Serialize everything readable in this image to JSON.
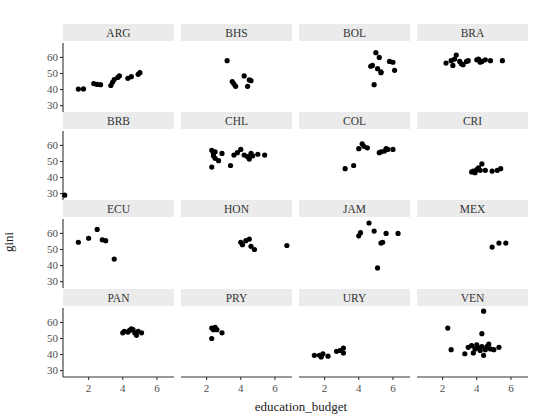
{
  "chart_data": {
    "type": "scatter",
    "title": "",
    "xlabel": "education_budget",
    "ylabel": "gini",
    "facet_layout": {
      "nrow": 4,
      "ncol": 4
    },
    "xlim": [
      0.5,
      7.0
    ],
    "ylim": [
      26,
      69
    ],
    "x_ticks": [
      2,
      4,
      6
    ],
    "y_ticks": [
      30,
      40,
      50,
      60
    ],
    "grid": false,
    "legend": "none",
    "panels": [
      {
        "label": "ARG",
        "points": [
          [
            1.4,
            40.3
          ],
          [
            1.7,
            40.4
          ],
          [
            2.3,
            43.7
          ],
          [
            2.5,
            43.2
          ],
          [
            2.7,
            43.0
          ],
          [
            3.3,
            42.5
          ],
          [
            3.4,
            44.5
          ],
          [
            3.5,
            46.2
          ],
          [
            3.7,
            47.5
          ],
          [
            3.8,
            48.5
          ],
          [
            4.3,
            47.0
          ],
          [
            4.5,
            48.0
          ],
          [
            4.9,
            49.5
          ],
          [
            5.0,
            50.5
          ]
        ]
      },
      {
        "label": "BHS",
        "points": [
          [
            3.2,
            58.0
          ],
          [
            3.5,
            45.0
          ],
          [
            3.6,
            43.5
          ],
          [
            3.7,
            42.0
          ],
          [
            4.2,
            48.5
          ],
          [
            4.4,
            42.0
          ],
          [
            4.5,
            46.0
          ],
          [
            4.6,
            45.5
          ]
        ]
      },
      {
        "label": "BOL",
        "points": [
          [
            5.0,
            63.0
          ],
          [
            5.2,
            60.0
          ],
          [
            4.8,
            55.0
          ],
          [
            4.7,
            54.5
          ],
          [
            5.1,
            53.0
          ],
          [
            5.3,
            51.0
          ],
          [
            5.3,
            50.5
          ],
          [
            5.8,
            57.5
          ],
          [
            6.0,
            57.0
          ],
          [
            6.1,
            52.0
          ],
          [
            4.9,
            43.0
          ]
        ]
      },
      {
        "label": "BRA",
        "points": [
          [
            2.2,
            56.5
          ],
          [
            2.5,
            58.0
          ],
          [
            2.6,
            55.0
          ],
          [
            2.7,
            59.0
          ],
          [
            2.8,
            61.5
          ],
          [
            3.0,
            57.5
          ],
          [
            3.1,
            56.0
          ],
          [
            3.2,
            55.5
          ],
          [
            3.4,
            57.5
          ],
          [
            3.5,
            58.0
          ],
          [
            4.0,
            58.5
          ],
          [
            4.1,
            59.0
          ],
          [
            4.2,
            57.0
          ],
          [
            4.3,
            57.5
          ],
          [
            4.5,
            58.5
          ],
          [
            4.8,
            58.0
          ],
          [
            5.5,
            58.0
          ]
        ]
      },
      {
        "label": "BRB",
        "points": [
          [
            0.6,
            29.0
          ]
        ]
      },
      {
        "label": "CHL",
        "points": [
          [
            2.3,
            57.0
          ],
          [
            2.4,
            55.0
          ],
          [
            2.4,
            53.5
          ],
          [
            2.5,
            56.0
          ],
          [
            2.5,
            52.0
          ],
          [
            2.7,
            50.5
          ],
          [
            2.3,
            46.5
          ],
          [
            2.9,
            55.0
          ],
          [
            3.4,
            47.5
          ],
          [
            3.6,
            54.0
          ],
          [
            3.8,
            55.5
          ],
          [
            4.0,
            57.5
          ],
          [
            4.2,
            54.0
          ],
          [
            4.4,
            53.0
          ],
          [
            4.5,
            51.5
          ],
          [
            4.6,
            55.0
          ],
          [
            4.7,
            53.5
          ],
          [
            5.0,
            54.5
          ],
          [
            5.4,
            54.0
          ]
        ]
      },
      {
        "label": "COL",
        "points": [
          [
            3.2,
            45.5
          ],
          [
            3.7,
            47.5
          ],
          [
            4.0,
            58.0
          ],
          [
            4.2,
            61.0
          ],
          [
            4.3,
            59.5
          ],
          [
            4.5,
            58.5
          ],
          [
            5.2,
            55.5
          ],
          [
            5.3,
            56.0
          ],
          [
            5.5,
            56.5
          ],
          [
            5.6,
            58.0
          ],
          [
            5.7,
            57.5
          ],
          [
            6.0,
            57.5
          ]
        ]
      },
      {
        "label": "CRI",
        "points": [
          [
            3.7,
            43.5
          ],
          [
            3.8,
            44.0
          ],
          [
            3.9,
            43.0
          ],
          [
            4.0,
            45.0
          ],
          [
            4.1,
            46.0
          ],
          [
            4.2,
            44.5
          ],
          [
            4.3,
            48.5
          ],
          [
            4.5,
            44.5
          ],
          [
            4.9,
            44.0
          ],
          [
            5.2,
            44.5
          ],
          [
            5.4,
            45.5
          ]
        ]
      },
      {
        "label": "ECU",
        "points": [
          [
            1.4,
            54.5
          ],
          [
            2.0,
            57.0
          ],
          [
            2.5,
            62.5
          ],
          [
            2.8,
            56.0
          ],
          [
            3.0,
            55.5
          ],
          [
            3.5,
            44.0
          ]
        ]
      },
      {
        "label": "HON",
        "points": [
          [
            4.0,
            54.5
          ],
          [
            4.1,
            53.0
          ],
          [
            4.3,
            55.5
          ],
          [
            4.5,
            56.5
          ],
          [
            4.6,
            52.0
          ],
          [
            4.8,
            50.0
          ],
          [
            6.7,
            52.5
          ]
        ]
      },
      {
        "label": "JAM",
        "points": [
          [
            4.0,
            58.5
          ],
          [
            4.1,
            60.5
          ],
          [
            4.6,
            66.5
          ],
          [
            4.9,
            61.5
          ],
          [
            5.3,
            54.0
          ],
          [
            5.4,
            54.5
          ],
          [
            5.6,
            60.0
          ],
          [
            6.3,
            60.0
          ],
          [
            5.1,
            38.5
          ]
        ]
      },
      {
        "label": "MEX",
        "points": [
          [
            4.9,
            51.5
          ],
          [
            5.3,
            54.0
          ],
          [
            5.7,
            54.0
          ]
        ]
      },
      {
        "label": "PAN",
        "points": [
          [
            4.0,
            53.5
          ],
          [
            4.1,
            54.5
          ],
          [
            4.3,
            54.0
          ],
          [
            4.4,
            55.0
          ],
          [
            4.5,
            56.0
          ],
          [
            4.6,
            55.5
          ],
          [
            4.7,
            53.5
          ],
          [
            4.8,
            52.0
          ],
          [
            4.9,
            54.5
          ],
          [
            5.1,
            53.5
          ]
        ]
      },
      {
        "label": "PRY",
        "points": [
          [
            2.3,
            50.0
          ],
          [
            2.3,
            56.5
          ],
          [
            2.4,
            55.5
          ],
          [
            2.5,
            57.0
          ],
          [
            2.6,
            55.5
          ],
          [
            2.9,
            53.5
          ]
        ]
      },
      {
        "label": "URY",
        "points": [
          [
            1.4,
            39.5
          ],
          [
            1.7,
            39.5
          ],
          [
            1.8,
            38.5
          ],
          [
            1.9,
            40.5
          ],
          [
            2.2,
            39.0
          ],
          [
            2.7,
            42.0
          ],
          [
            2.9,
            42.5
          ],
          [
            3.1,
            41.0
          ],
          [
            3.1,
            44.0
          ]
        ]
      },
      {
        "label": "VEN",
        "points": [
          [
            2.3,
            56.5
          ],
          [
            2.5,
            43.0
          ],
          [
            3.3,
            40.5
          ],
          [
            3.5,
            44.5
          ],
          [
            3.7,
            45.5
          ],
          [
            3.8,
            41.0
          ],
          [
            3.9,
            43.5
          ],
          [
            4.0,
            46.0
          ],
          [
            4.1,
            44.0
          ],
          [
            4.2,
            42.5
          ],
          [
            4.3,
            53.0
          ],
          [
            4.3,
            45.0
          ],
          [
            4.4,
            67.0
          ],
          [
            4.4,
            39.5
          ],
          [
            4.5,
            43.0
          ],
          [
            4.6,
            45.0
          ],
          [
            4.7,
            46.5
          ],
          [
            4.8,
            43.5
          ],
          [
            5.0,
            43.0
          ],
          [
            5.3,
            44.5
          ]
        ]
      }
    ]
  },
  "colors": {
    "strip_background": "#ebebeb",
    "point": "#000000",
    "axis": "#333333"
  }
}
